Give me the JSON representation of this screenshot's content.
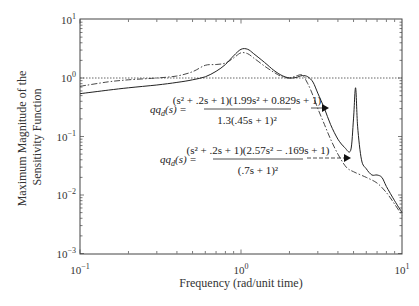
{
  "chart_data": {
    "type": "line",
    "xscale": "log",
    "yscale": "log",
    "xlabel": "Frequency (rad/unit time)",
    "ylabel": [
      "Maximum Magnitude of the",
      "Sensitivity Function"
    ],
    "xlim": [
      0.1,
      10
    ],
    "ylim": [
      0.001,
      10
    ],
    "xticks": [
      {
        "v": 0.1,
        "base": "10",
        "exp": "−1"
      },
      {
        "v": 1,
        "base": "10",
        "exp": "0"
      },
      {
        "v": 10,
        "base": "10",
        "exp": "1"
      }
    ],
    "yticks": [
      {
        "v": 10,
        "base": "10",
        "exp": "1"
      },
      {
        "v": 1,
        "base": "10",
        "exp": "0"
      },
      {
        "v": 0.1,
        "base": "10",
        "exp": "−1"
      },
      {
        "v": 0.01,
        "base": "10",
        "exp": "−2"
      },
      {
        "v": 0.001,
        "base": "10",
        "exp": "−3"
      }
    ],
    "grid": false,
    "series": [
      {
        "name": "qq_d(s) = (s^2+.2s+1)(1.99s^2+0.829s+1) / 1.3(.45s+1)^2",
        "style": "solid",
        "x": [
          0.1,
          0.15,
          0.2,
          0.3,
          0.4,
          0.5,
          0.6,
          0.7,
          0.8,
          0.9,
          1.0,
          1.1,
          1.2,
          1.4,
          1.6,
          1.8,
          2.0,
          2.2,
          2.4,
          2.6,
          2.8,
          3.0,
          3.3,
          3.6,
          4.0,
          4.4,
          4.8,
          5.0,
          5.15,
          5.3,
          5.6,
          6.0,
          6.5,
          7.0,
          7.5,
          8.0,
          9.0,
          10.0
        ],
        "y": [
          0.54,
          0.62,
          0.68,
          0.76,
          0.84,
          0.93,
          1.05,
          1.3,
          1.7,
          2.4,
          3.1,
          3.1,
          2.6,
          1.85,
          1.35,
          1.1,
          1.0,
          1.02,
          1.1,
          1.05,
          0.85,
          0.55,
          0.3,
          0.16,
          0.09,
          0.065,
          0.058,
          0.2,
          0.68,
          0.15,
          0.04,
          0.028,
          0.022,
          0.022,
          0.02,
          0.014,
          0.008,
          0.005
        ]
      },
      {
        "name": "qq_d(s) = (s^2+.2s+1)(2.57s^2-.169s+1) / (.7s+1)^2",
        "style": "dash-dot",
        "x": [
          0.1,
          0.15,
          0.2,
          0.3,
          0.4,
          0.5,
          0.6,
          0.7,
          0.8,
          0.9,
          1.0,
          1.1,
          1.2,
          1.4,
          1.6,
          1.8,
          2.0,
          2.2,
          2.4,
          2.6,
          2.8,
          3.0,
          3.3,
          3.6,
          4.0,
          4.5,
          5.0,
          6.0,
          7.0,
          8.0,
          9.0,
          10.0
        ],
        "y": [
          0.72,
          0.86,
          0.93,
          1.0,
          1.08,
          1.28,
          1.65,
          1.7,
          1.8,
          2.2,
          2.7,
          2.6,
          2.2,
          1.6,
          1.25,
          1.05,
          1.0,
          1.08,
          1.12,
          0.8,
          0.5,
          0.3,
          0.16,
          0.09,
          0.05,
          0.03,
          0.025,
          0.02,
          0.016,
          0.011,
          0.007,
          0.0045
        ]
      },
      {
        "name": "Reference line |S| = 1",
        "style": "dotted",
        "x": [
          0.1,
          10
        ],
        "y": [
          1,
          1
        ]
      }
    ],
    "annotations": [
      {
        "id": "eq1",
        "lhs": "qq",
        "lhs_sub": "d",
        "lhs_arg": "(s) =",
        "numerator": "(s² + .2s + 1)(1.99s² + 0.829s + 1)",
        "denominator": "1.3(.45s + 1)²",
        "arrow_to_series": 0,
        "arrow_style": "solid"
      },
      {
        "id": "eq2",
        "lhs": "qq",
        "lhs_sub": "d",
        "lhs_arg": "(s) =",
        "numerator": "(s² + .2s + 1)(2.57s² − .169s + 1)",
        "denominator": "(.7s + 1)²",
        "arrow_to_series": 1,
        "arrow_style": "dashed"
      }
    ]
  },
  "colors": {
    "line": "#222222",
    "axis": "#444444",
    "reference": "#555555"
  }
}
